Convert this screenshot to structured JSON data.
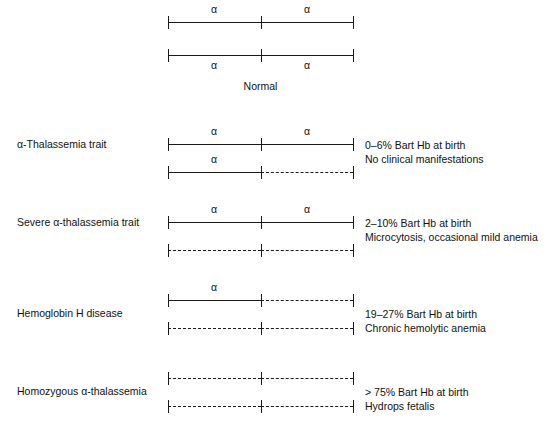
{
  "figure": {
    "title_caption": "Normal",
    "gene_symbol": "α"
  },
  "rows": [
    {
      "name": "normal",
      "condition_label": "",
      "chromosome_top": {
        "left_segment": "solid",
        "right_segment": "solid",
        "alpha_left": "α",
        "alpha_right": "α",
        "alpha_position": "above"
      },
      "chromosome_bottom": {
        "left_segment": "solid",
        "right_segment": "solid",
        "alpha_left": "α",
        "alpha_right": "α",
        "alpha_position": "below"
      },
      "annotation_lines": []
    },
    {
      "name": "alpha-thalassemia-trait",
      "condition_label": "α-Thalassemia trait",
      "chromosome_top": {
        "left_segment": "solid",
        "right_segment": "solid",
        "alpha_left": "α",
        "alpha_right": "α",
        "alpha_position": "above"
      },
      "chromosome_bottom": {
        "left_segment": "solid",
        "right_segment": "dashed",
        "alpha_left": "α",
        "alpha_right": "",
        "alpha_position": "above"
      },
      "annotation_lines": [
        "0–6% Bart Hb at birth",
        "No clinical manifestations"
      ]
    },
    {
      "name": "severe-alpha-thalassemia-trait",
      "condition_label": "Severe α-thalassemia trait",
      "chromosome_top": {
        "left_segment": "solid",
        "right_segment": "solid",
        "alpha_left": "α",
        "alpha_right": "α",
        "alpha_position": "above"
      },
      "chromosome_bottom": {
        "left_segment": "dashed",
        "right_segment": "dashed",
        "alpha_left": "",
        "alpha_right": "",
        "alpha_position": "above"
      },
      "annotation_lines": [
        "2–10% Bart Hb at birth",
        "Microcytosis, occasional mild anemia"
      ]
    },
    {
      "name": "hemoglobin-h-disease",
      "condition_label": "Hemoglobin H disease",
      "chromosome_top": {
        "left_segment": "solid",
        "right_segment": "dashed",
        "alpha_left": "α",
        "alpha_right": "",
        "alpha_position": "above"
      },
      "chromosome_bottom": {
        "left_segment": "dashed",
        "right_segment": "dashed",
        "alpha_left": "",
        "alpha_right": "",
        "alpha_position": "above"
      },
      "annotation_lines": [
        "19–27% Bart Hb at birth",
        "Chronic hemolytic anemia"
      ]
    },
    {
      "name": "homozygous-alpha-thalassemia",
      "condition_label": "Homozygous α-thalassemia",
      "chromosome_top": {
        "left_segment": "dashed",
        "right_segment": "dashed",
        "alpha_left": "",
        "alpha_right": "",
        "alpha_position": "above"
      },
      "chromosome_bottom": {
        "left_segment": "dashed",
        "right_segment": "dashed",
        "alpha_left": "",
        "alpha_right": "",
        "alpha_position": "above"
      },
      "annotation_lines": [
        "> 75% Bart Hb at birth",
        "Hydrops fetalis"
      ]
    }
  ]
}
